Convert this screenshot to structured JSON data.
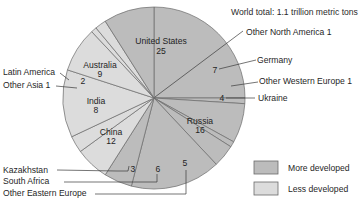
{
  "chart_data": {
    "type": "pie",
    "title": "World total: 1.1 trillion metric tons",
    "unit": "percent",
    "start_angle": "12 o'clock, clockwise",
    "slices": [
      {
        "label": "United States",
        "value": 25,
        "group": "More developed"
      },
      {
        "label": "Other North America",
        "value": 1,
        "group": "More developed"
      },
      {
        "label": "Germany",
        "value": 7,
        "group": "More developed"
      },
      {
        "label": "Other Western Europe",
        "value": 1,
        "group": "More developed"
      },
      {
        "label": "Ukraine",
        "value": 4,
        "group": "More developed"
      },
      {
        "label": "Russia",
        "value": 16,
        "group": "More developed"
      },
      {
        "label": "Other Eastern Europe",
        "value": 5,
        "group": "More developed"
      },
      {
        "label": "South Africa",
        "value": 6,
        "group": "Less developed"
      },
      {
        "label": "Kazakhstan",
        "value": 3,
        "group": "Less developed"
      },
      {
        "label": "China",
        "value": 12,
        "group": "Less developed"
      },
      {
        "label": "India",
        "value": 8,
        "group": "Less developed"
      },
      {
        "label": "Other Asia",
        "value": 1,
        "group": "Less developed"
      },
      {
        "label": "Latin America",
        "value": 2,
        "group": "Less developed"
      },
      {
        "label": "Australia",
        "value": 9,
        "group": "More developed"
      }
    ],
    "legend": [
      {
        "label": "More developed",
        "color": "#bcbcbc"
      },
      {
        "label": "Less developed",
        "color": "#dcdcdc"
      }
    ],
    "legend_position": "bottom-right"
  },
  "labels": {
    "title": "World total: 1.1 trillion metric tons",
    "us_name": "United States",
    "us_val": "25",
    "australia_name": "Australia",
    "australia_val": "9",
    "india_name": "India",
    "india_val": "8",
    "china_name": "China",
    "china_val": "12",
    "russia_name": "Russia",
    "russia_val": "16",
    "other_na": "Other North America 1",
    "germany_name": "Germany",
    "germany_val": "7",
    "other_we": "Other Western Europe 1",
    "ukraine_name": "Ukraine",
    "ukraine_val": "4",
    "latin_america_name": "Latin America",
    "latin_america_val": "2",
    "other_asia": "Other Asia 1",
    "kazakhstan_name": "Kazakhstan",
    "kazakhstan_val": "3",
    "south_africa_name": "South Africa",
    "south_africa_val": "6",
    "other_ee_name": "Other Eastern Europe",
    "other_ee_val": "5",
    "legend_more": "More developed",
    "legend_less": "Less developed"
  },
  "colors": {
    "more_developed": "#bcbcbc",
    "less_developed": "#dcdcdc",
    "outline": "#6a6a6a",
    "leader": "#3a3a3a"
  }
}
